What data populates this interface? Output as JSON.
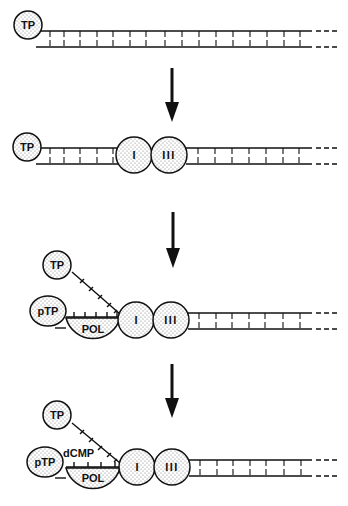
{
  "diagram": {
    "colors": {
      "ink": "#111111",
      "fill_dots": "#9a9a9a",
      "background": "#ffffff"
    },
    "stage1": {
      "tp": "TP"
    },
    "stage2": {
      "tp": "TP",
      "protein_i": "I",
      "protein_iii": "III"
    },
    "stage3": {
      "tp": "TP",
      "ptp": "pTP",
      "pol": "POL",
      "protein_i": "I",
      "protein_iii": "III"
    },
    "stage4": {
      "tp": "TP",
      "ptp": "pTP",
      "dcmp": "dCMP",
      "pol": "POL",
      "protein_i": "I",
      "protein_iii": "III"
    },
    "arrows": [
      "down-arrow",
      "down-arrow",
      "down-arrow"
    ]
  }
}
